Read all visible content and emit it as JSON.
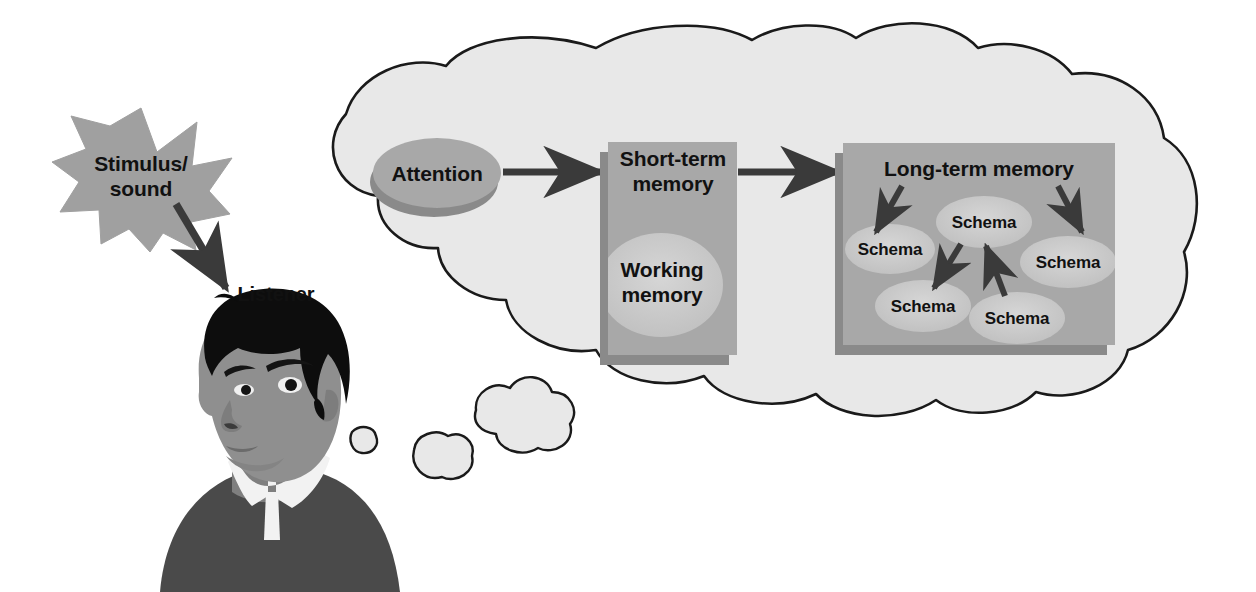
{
  "figure": {
    "background_color": "#ffffff"
  },
  "palette": {
    "cloud_fill": "#e8e8e8",
    "cloud_stroke": "#1a1a1a",
    "box_fill": "#a8a8a8",
    "box_shadow": "#8a8a8a",
    "ellipse_fill": "#c8c8c8",
    "attention_fill": "#a8a8a8",
    "attention_shadow": "#8a8a8a",
    "star_fill": "#a0a0a0",
    "arrow_color": "#3a3a3a",
    "skin": "#8f8f8f",
    "hair": "#0d0d0d",
    "shirt": "#4a4a4a",
    "collar": "#f2f2f2",
    "text_color": "#111111"
  },
  "labels": {
    "stimulus": "Stimulus/\nsound",
    "listener": "Listener",
    "attention": "Attention",
    "short_term_memory": "Short-term\nmemory",
    "working_memory": "Working\nmemory",
    "long_term_memory": "Long-term memory"
  },
  "schemas": [
    {
      "id": "schema-left",
      "label": "Schema",
      "cx": 890,
      "cy": 249,
      "rx": 44,
      "ry": 24
    },
    {
      "id": "schema-center-top",
      "label": "Schema",
      "cx": 984,
      "cy": 222,
      "rx": 47,
      "ry": 25
    },
    {
      "id": "schema-right",
      "label": "Schema",
      "cx": 1068,
      "cy": 262,
      "rx": 47,
      "ry": 25
    },
    {
      "id": "schema-bottom-left",
      "label": "Schema",
      "cx": 923,
      "cy": 306,
      "rx": 47,
      "ry": 25
    },
    {
      "id": "schema-bottom-right",
      "label": "Schema",
      "cx": 1017,
      "cy": 318,
      "rx": 47,
      "ry": 25
    }
  ],
  "flow_arrows": [
    {
      "id": "attention-to-stm",
      "from": "Attention",
      "to": "Short-term memory"
    },
    {
      "id": "stm-to-ltm",
      "from": "Short-term memory",
      "to": "Long-term memory"
    },
    {
      "id": "stimulus-to-listener",
      "from": "Stimulus/sound",
      "to": "Listener"
    }
  ],
  "schema_arrows": [
    {
      "id": "ltm-to-schema-left",
      "from": "Long-term memory",
      "to": "Schema (left)"
    },
    {
      "id": "ltm-to-schema-right",
      "from": "Long-term memory",
      "to": "Schema (right)"
    },
    {
      "id": "schema-center-to-bottom-left",
      "from": "Schema (center)",
      "to": "Schema (bottom-left)"
    },
    {
      "id": "schema-bottom-right-to-center",
      "from": "Schema (bottom-right)",
      "to": "Schema (center)"
    }
  ],
  "boxes": [
    {
      "id": "short-term-memory-box",
      "label": "Short-term\nmemory",
      "x": 608,
      "y": 142,
      "w": 129,
      "h": 213
    },
    {
      "id": "long-term-memory-box",
      "label": "Long-term memory",
      "x": 843,
      "y": 143,
      "w": 272,
      "h": 202
    }
  ],
  "thought_bubbles": [
    {
      "id": "thought-bubble-small",
      "cx": 363,
      "cy": 440,
      "r": 13
    },
    {
      "id": "thought-bubble-medium",
      "cx": 434,
      "cy": 457,
      "r": 22
    },
    {
      "id": "thought-bubble-large",
      "cx": 510,
      "cy": 415,
      "r": 31
    }
  ]
}
